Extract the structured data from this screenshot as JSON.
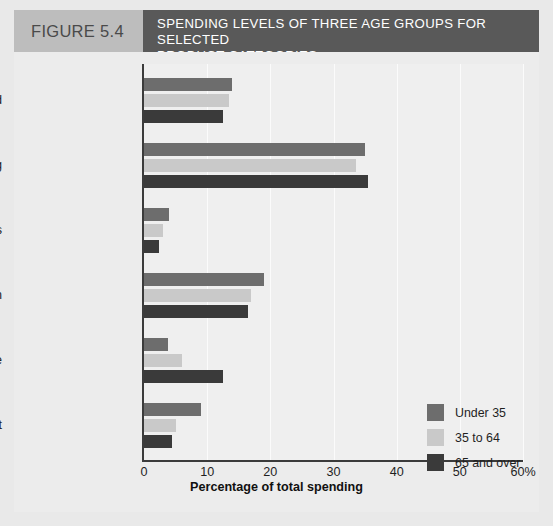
{
  "header": {
    "figure_label": "FIGURE 5.4",
    "title_line1": "SPENDING LEVELS OF THREE AGE GROUPS FOR SELECTED",
    "title_line2": "PRODUCT CATEGORIES"
  },
  "colors": {
    "series_under35": "#6d6d6d",
    "series_35to64": "#c9c9c9",
    "series_65plus": "#3a3a3a",
    "header_label_bg": "#bdbdbd",
    "header_title_bg": "#595959",
    "panel_bg": "#ececec",
    "plot_bg": "#efefef",
    "axis": "#3b3b3b"
  },
  "chart_data": {
    "type": "bar",
    "orientation": "horizontal",
    "title": "SPENDING LEVELS OF THREE AGE GROUPS FOR SELECTED PRODUCT CATEGORIES",
    "xlabel": "Percentage of total spending",
    "ylabel": "",
    "xlim": [
      0,
      60
    ],
    "xticks": [
      0,
      10,
      20,
      30,
      40,
      50,
      60
    ],
    "xtick_labels": [
      "0",
      "10",
      "20",
      "30",
      "40",
      "50",
      "60%"
    ],
    "grid": "vertical",
    "legend_position": "inside-right",
    "categories": [
      "Food",
      "Housing",
      "Apparel and Services",
      "Transportation",
      "Health Care",
      "Entertainment"
    ],
    "series": [
      {
        "name": "Under 35",
        "color": "#6d6d6d",
        "values": [
          14.0,
          35.0,
          4.0,
          19.0,
          3.8,
          9.0
        ]
      },
      {
        "name": "35 to 64",
        "color": "#c9c9c9",
        "values": [
          13.5,
          33.5,
          3.0,
          17.0,
          6.0,
          5.0
        ]
      },
      {
        "name": "65 and over",
        "color": "#3a3a3a",
        "values": [
          12.5,
          35.5,
          2.3,
          16.5,
          12.5,
          4.5
        ]
      }
    ]
  },
  "axis": {
    "x_title": "Percentage of total spending"
  },
  "legend": {
    "items": [
      {
        "label": "Under 35",
        "color": "#6d6d6d"
      },
      {
        "label": "35 to 64",
        "color": "#c9c9c9"
      },
      {
        "label": "65 and over",
        "color": "#3a3a3a"
      }
    ]
  }
}
